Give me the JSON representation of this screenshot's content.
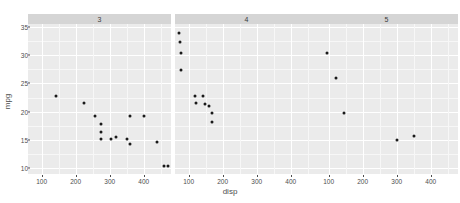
{
  "chart_data": {
    "type": "scatter",
    "title": "",
    "xlabel": "disp",
    "ylabel": "mpg",
    "xlim": [
      60,
      480
    ],
    "ylim": [
      9,
      35.5
    ],
    "xticks": [
      100,
      200,
      300,
      400
    ],
    "yticks": [
      10,
      15,
      20,
      25,
      30,
      35
    ],
    "grid": true,
    "legend": "none",
    "facet_by": "gear",
    "facets": [
      {
        "label": "3",
        "points": [
          {
            "x": 140.8,
            "y": 22.8
          },
          {
            "x": 225.0,
            "y": 21.5
          },
          {
            "x": 258.0,
            "y": 19.2
          },
          {
            "x": 275.8,
            "y": 17.8
          },
          {
            "x": 275.8,
            "y": 16.4
          },
          {
            "x": 275.8,
            "y": 15.2
          },
          {
            "x": 304.0,
            "y": 15.2
          },
          {
            "x": 318.0,
            "y": 15.5
          },
          {
            "x": 350.0,
            "y": 15.2
          },
          {
            "x": 360.0,
            "y": 14.3
          },
          {
            "x": 360.0,
            "y": 19.2
          },
          {
            "x": 400.0,
            "y": 19.2
          },
          {
            "x": 440.0,
            "y": 14.7
          },
          {
            "x": 460.0,
            "y": 10.4
          },
          {
            "x": 472.0,
            "y": 10.4
          }
        ]
      },
      {
        "label": "4",
        "points": [
          {
            "x": 71.1,
            "y": 33.9
          },
          {
            "x": 75.7,
            "y": 32.4
          },
          {
            "x": 78.7,
            "y": 30.4
          },
          {
            "x": 79.0,
            "y": 27.3
          },
          {
            "x": 120.1,
            "y": 22.8
          },
          {
            "x": 140.8,
            "y": 22.8
          },
          {
            "x": 146.7,
            "y": 21.4
          },
          {
            "x": 121.0,
            "y": 21.5
          },
          {
            "x": 160.0,
            "y": 21.0
          },
          {
            "x": 167.6,
            "y": 19.7
          },
          {
            "x": 167.6,
            "y": 18.1
          }
        ]
      },
      {
        "label": "5",
        "points": [
          {
            "x": 95.1,
            "y": 30.4
          },
          {
            "x": 120.3,
            "y": 26.0
          },
          {
            "x": 145.0,
            "y": 19.7
          },
          {
            "x": 301.0,
            "y": 15.0
          },
          {
            "x": 351.0,
            "y": 15.8
          }
        ]
      }
    ]
  },
  "colors": {
    "panel_bg": "#ebebeb",
    "strip_bg": "#d5d5d5",
    "grid_major": "#ffffff",
    "grid_minor": "#f7f7f7",
    "point": "#1a1a1a",
    "text": "#4d4d4d"
  }
}
